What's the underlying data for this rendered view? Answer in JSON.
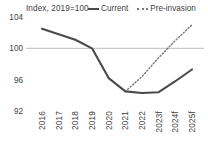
{
  "chart_data": {
    "type": "line",
    "title": "Index, 2019=100",
    "xlabel": "",
    "ylabel": "",
    "ylim": [
      92,
      104
    ],
    "yticks": [
      92,
      96,
      100,
      104
    ],
    "grid": "single horizontal gridline at 100",
    "legend_position": "top-right",
    "categories": [
      "2016",
      "2017",
      "2018",
      "2019",
      "2020",
      "2021",
      "2022",
      "2023f",
      "2024f",
      "2025f"
    ],
    "series": [
      {
        "name": "Current",
        "style": "solid",
        "color": "#4a4a4a",
        "values": [
          102.5,
          101.8,
          101.1,
          100.0,
          96.2,
          94.5,
          94.3,
          94.4,
          95.8,
          97.3
        ]
      },
      {
        "name": "Pre-invasion",
        "style": "dotted",
        "color": "#7a7a7a",
        "values": [
          null,
          null,
          null,
          null,
          null,
          94.5,
          96.4,
          98.8,
          101.0,
          103.0
        ]
      }
    ]
  },
  "header": {
    "title": "Index, 2019=100"
  },
  "legend": {
    "items": [
      {
        "label": "Current",
        "marker": "solid-line-swatch"
      },
      {
        "label": "Pre-invasion",
        "marker": "dotted-line-swatch"
      }
    ]
  },
  "axes": {
    "y": {
      "ticks": [
        "104",
        "100",
        "96",
        "92"
      ]
    },
    "x": {
      "ticks": [
        "2016",
        "2017",
        "2018",
        "2019",
        "2020",
        "2021",
        "2022",
        "2023f",
        "2024f",
        "2025f"
      ]
    }
  },
  "colors": {
    "current_line": "#4a4a4a",
    "preinvasion_line": "#7a7a7a",
    "gridline": "#c9c9c9",
    "text": "#3f3f3f",
    "background": "#ffffff"
  }
}
